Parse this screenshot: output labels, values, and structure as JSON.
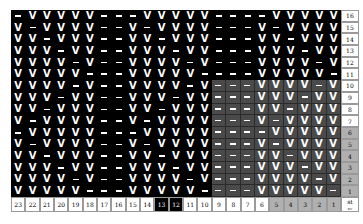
{
  "chart_title": "",
  "legend": {
    "V": "knit stitch",
    "–": "purl stitch"
  },
  "colors": {
    "background": "#000000",
    "highlight": "#4a4a4a",
    "label_highlight": "#b0b0b0",
    "label_default": "#ffffff"
  },
  "column_labels": [
    "23",
    "22",
    "21",
    "20",
    "19",
    "18",
    "17",
    "16",
    "15",
    "14",
    "13",
    "12",
    "11",
    "10",
    "9",
    "8",
    "7",
    "6",
    "5",
    "4",
    "3",
    "2",
    "1"
  ],
  "corner_label": {
    "line1": "st",
    "line2": "←"
  },
  "highlighted_column_labels": [
    "5",
    "4",
    "3",
    "2",
    "1"
  ],
  "dark_column_labels": [
    "13",
    "12"
  ],
  "row_labels": [
    "16",
    "15",
    "14",
    "13",
    "12",
    "11",
    "10",
    "9",
    "8",
    "7",
    "6",
    "5",
    "4",
    "3",
    "2",
    "1"
  ],
  "highlighted_row_labels": [
    "6",
    "5",
    "4",
    "3",
    "2",
    "1"
  ],
  "shaded_region": {
    "columns": "9-1",
    "rows": "10-1"
  },
  "rows": [
    {
      "row": "16",
      "cells": "–VVVVV–––VVVVV––––VVVVV"
    },
    {
      "row": "15",
      "cells": "V–VVVV––V–VVVV–––V–VVVV"
    },
    {
      "row": "14",
      "cells": "VV–VVV––VV–VVV–––VV–VVV"
    },
    {
      "row": "13",
      "cells": "VVV–VV––VVV–VV–––VVV–VV"
    },
    {
      "row": "12",
      "cells": "VVVV–V––VVVV–V–––VVVV–V"
    },
    {
      "row": "11",
      "cells": "VVVVV–––VVVVV––––VVVVV–"
    },
    {
      "row": "10",
      "cells": "VVVV–V––VVVV–V–––VVVV–V"
    },
    {
      "row": "9",
      "cells": "VVV–VV––VVV–VV–––VVV–VV"
    },
    {
      "row": "8",
      "cells": "VV–VVV––VV–VVV–––VV–VVV"
    },
    {
      "row": "7",
      "cells": "V–VVVV––V–VVVV–––V–VVVV"
    },
    {
      "row": "6",
      "cells": "–VVVVV–––VVVVV––––VVVVV"
    },
    {
      "row": "5",
      "cells": "V–VVVV––V–VVVV–––V–VVVV"
    },
    {
      "row": "4",
      "cells": "VV–VVV––VV–VVV–––VV–VVV"
    },
    {
      "row": "3",
      "cells": "VVV–VV––VVV–VV–––VVV–VV"
    },
    {
      "row": "2",
      "cells": "VVVV–V––VVVV–V–––VVVV–V"
    },
    {
      "row": "1",
      "cells": "VVVVV–––VVVVV––––VVVVV–"
    }
  ]
}
